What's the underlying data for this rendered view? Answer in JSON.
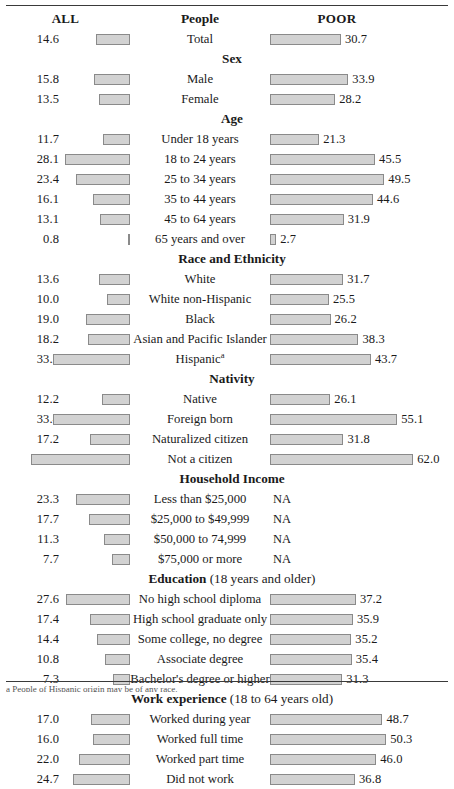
{
  "header": {
    "left_label": "ALL",
    "center_label": "People",
    "right_label": "POOR"
  },
  "footnote": "a People of Hispanic origin may be of any race.",
  "na_label": "NA",
  "colors": {
    "bar_fill": "#d2d2d2",
    "bar_border": "#8a8a8a",
    "rule": "#3a3a3a",
    "text": "#1a1a1a"
  },
  "chart_data": {
    "type": "bar",
    "title": "People",
    "subtitle": "",
    "xlabel": "",
    "ylabel": "",
    "orientation": "horizontal",
    "layout": "diverging-paired: ALL bars grow leftward from a shared right edge, POOR bars grow rightward from a shared left edge",
    "grid": false,
    "legend": "none",
    "axis_units": "percent",
    "px_per_unit": 2.31,
    "xlim": [
      0,
      62
    ],
    "series": [
      {
        "name": "ALL",
        "side": "left"
      },
      {
        "name": "POOR",
        "side": "right"
      }
    ],
    "sections": [
      {
        "heading": "",
        "heading_sub": "",
        "rows": [
          {
            "label": "Total",
            "all": 14.6,
            "poor": 30.7
          }
        ]
      },
      {
        "heading": "Sex",
        "heading_sub": "",
        "rows": [
          {
            "label": "Male",
            "all": 15.8,
            "poor": 33.9
          },
          {
            "label": "Female",
            "all": 13.5,
            "poor": 28.2
          }
        ]
      },
      {
        "heading": "Age",
        "heading_sub": "",
        "rows": [
          {
            "label": "Under 18 years",
            "all": 11.7,
            "poor": 21.3
          },
          {
            "label": "18 to 24 years",
            "all": 28.1,
            "poor": 45.5
          },
          {
            "label": "25 to 34 years",
            "all": 23.4,
            "poor": 49.5
          },
          {
            "label": "35 to 44 years",
            "all": 16.1,
            "poor": 44.6
          },
          {
            "label": "45 to 64 years",
            "all": 13.1,
            "poor": 31.9
          },
          {
            "label": "65 years and over",
            "all": 0.8,
            "poor": 2.7
          }
        ]
      },
      {
        "heading": "Race and Ethnicity",
        "heading_sub": "",
        "rows": [
          {
            "label": "White",
            "all": 13.6,
            "poor": 31.7
          },
          {
            "label": "White non-Hispanic",
            "all": 10.0,
            "poor": 25.5
          },
          {
            "label": "Black",
            "all": 19.0,
            "poor": 26.2
          },
          {
            "label": "Asian and Pacific Islander",
            "all": 18.2,
            "poor": 38.3
          },
          {
            "label": "Hispanic",
            "footnote_marker": "a",
            "all": 33.2,
            "poor": 43.7
          }
        ]
      },
      {
        "heading": "Nativity",
        "heading_sub": "",
        "rows": [
          {
            "label": "Native",
            "all": 12.2,
            "poor": 26.1
          },
          {
            "label": "Foreign born",
            "all": 33.4,
            "poor": 55.1
          },
          {
            "label": "Naturalized citizen",
            "all": 17.2,
            "poor": 31.8
          },
          {
            "label": "Not a citizen",
            "all": 42.9,
            "poor": 62.0
          }
        ]
      },
      {
        "heading": "Household Income",
        "heading_sub": "",
        "rows": [
          {
            "label": "Less than $25,000",
            "all": 23.3,
            "poor": null
          },
          {
            "label": "$25,000 to $49,999",
            "all": 17.7,
            "poor": null
          },
          {
            "label": "$50,000 to 74,999",
            "all": 11.3,
            "poor": null
          },
          {
            "label": "$75,000 or more",
            "all": 7.7,
            "poor": null
          }
        ]
      },
      {
        "heading": "Education",
        "heading_sub": "(18 years and older)",
        "rows": [
          {
            "label": "No high school diploma",
            "all": 27.6,
            "poor": 37.2
          },
          {
            "label": "High school graduate only",
            "all": 17.4,
            "poor": 35.9
          },
          {
            "label": "Some college, no degree",
            "all": 14.4,
            "poor": 35.2
          },
          {
            "label": "Associate degree",
            "all": 10.8,
            "poor": 35.4
          },
          {
            "label": "Bachelor's degree or higher",
            "all": 7.3,
            "poor": 31.3
          }
        ]
      },
      {
        "heading": "Work experience",
        "heading_sub": "(18 to 64 years old)",
        "rows": [
          {
            "label": "Worked during year",
            "all": 17.0,
            "poor": 48.7
          },
          {
            "label": "Worked full time",
            "all": 16.0,
            "poor": 50.3
          },
          {
            "label": "Worked part time",
            "all": 22.0,
            "poor": 46.0
          },
          {
            "label": "Did not work",
            "all": 24.7,
            "poor": 36.8
          }
        ]
      }
    ]
  }
}
